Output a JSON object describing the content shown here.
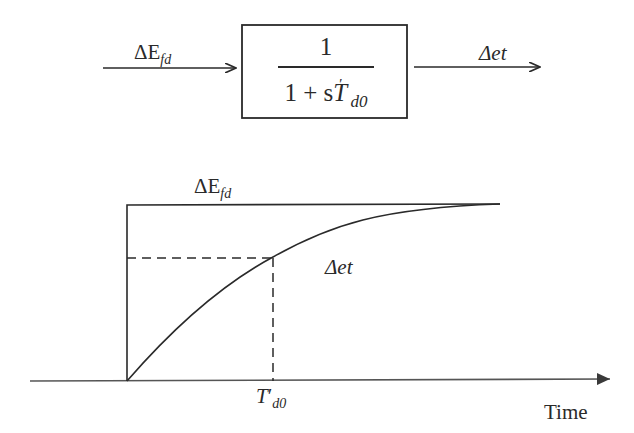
{
  "block_diagram": {
    "input_label": {
      "main": "ΔE",
      "sub": "fd"
    },
    "transfer_function": {
      "numerator": "1",
      "denominator_prefix": "1 + s",
      "denominator_var": "T",
      "denominator_prime": "′",
      "denominator_sub": "d0"
    },
    "output_label": "Δet"
  },
  "response_plot": {
    "step_label": {
      "main": "ΔE",
      "sub": "fd"
    },
    "curve_label": "Δet",
    "time_constant_label": {
      "main": "T",
      "prime": "′",
      "sub": "d0"
    },
    "x_axis_label": "Time"
  },
  "colors": {
    "line": "#2a2a2a",
    "background": "#ffffff"
  }
}
